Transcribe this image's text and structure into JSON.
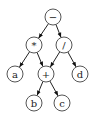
{
  "diagram": {
    "type": "expression-dag",
    "nodes": [
      {
        "id": "minus",
        "label": "−",
        "x": 53,
        "y": 17
      },
      {
        "id": "times",
        "label": "*",
        "x": 34,
        "y": 45
      },
      {
        "id": "divide",
        "label": "/",
        "x": 64,
        "y": 45
      },
      {
        "id": "a",
        "label": "a",
        "x": 15,
        "y": 74
      },
      {
        "id": "plus",
        "label": "+",
        "x": 46,
        "y": 74
      },
      {
        "id": "d",
        "label": "d",
        "x": 80,
        "y": 74
      },
      {
        "id": "b",
        "label": "b",
        "x": 34,
        "y": 103
      },
      {
        "id": "c",
        "label": "c",
        "x": 62,
        "y": 103
      }
    ],
    "edges": [
      {
        "from": "minus",
        "to": "times"
      },
      {
        "from": "minus",
        "to": "divide"
      },
      {
        "from": "times",
        "to": "a"
      },
      {
        "from": "times",
        "to": "plus"
      },
      {
        "from": "divide",
        "to": "plus"
      },
      {
        "from": "divide",
        "to": "d"
      },
      {
        "from": "plus",
        "to": "b"
      },
      {
        "from": "plus",
        "to": "c"
      }
    ]
  }
}
